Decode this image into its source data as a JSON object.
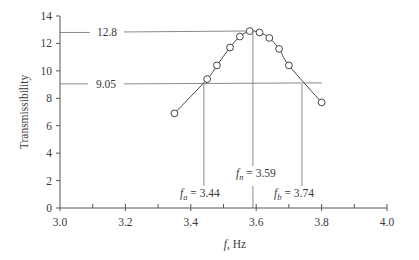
{
  "chart_data": {
    "type": "line",
    "title": "",
    "xlabel": "f, Hz",
    "xlabel_italic_part": "f",
    "xlabel_rest": ", Hz",
    "ylabel": "Transmissibility",
    "xlim": [
      3.0,
      4.0
    ],
    "ylim": [
      0,
      14
    ],
    "xticks_major": [
      3.0,
      3.2,
      3.4,
      3.6,
      3.8,
      4.0
    ],
    "xtick_labels": [
      "3.0",
      "3.2",
      "3.4",
      "3.6",
      "3.8",
      "4.0"
    ],
    "xticks_minor_step": 0.1,
    "yticks": [
      0,
      2,
      4,
      6,
      8,
      10,
      12,
      14
    ],
    "ytick_labels": [
      "0",
      "2",
      "4",
      "6",
      "8",
      "10",
      "12",
      "14"
    ],
    "grid": false,
    "legend": "none",
    "series": [
      {
        "name": "Transmissibility",
        "marker": "open-circle",
        "x": [
          3.35,
          3.45,
          3.48,
          3.52,
          3.55,
          3.58,
          3.61,
          3.64,
          3.67,
          3.7,
          3.8
        ],
        "y": [
          6.9,
          9.4,
          10.4,
          11.7,
          12.5,
          12.9,
          12.8,
          12.4,
          11.6,
          10.4,
          7.7
        ]
      }
    ],
    "reference_lines": {
      "peak_value": 12.8,
      "peak_label": "12.8",
      "half_power_value": 9.05,
      "half_power_label": "9.05",
      "fa": 3.44,
      "fn": 3.59,
      "fb": 3.74
    },
    "annotations": [
      {
        "id": "fa",
        "symbol": "f",
        "sub": "a",
        "text": " = 3.44"
      },
      {
        "id": "fn",
        "symbol": "f",
        "sub": "n",
        "text": " = 3.59"
      },
      {
        "id": "fb",
        "symbol": "f",
        "sub": "b",
        "text": " = 3.74"
      }
    ]
  },
  "colors": {
    "axis": "#555555",
    "curve": "#444444",
    "ref_line": "#8a8a8a",
    "marker_fill": "#ffffff",
    "text": "#3a3a3a"
  }
}
